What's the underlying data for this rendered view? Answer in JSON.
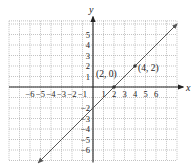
{
  "chart_data": {
    "type": "line",
    "title": "",
    "xlabel": "x",
    "ylabel": "y",
    "xlim": [
      -8,
      8
    ],
    "ylim": [
      -7,
      6.3
    ],
    "grid": true,
    "x_tick_labels": [
      "-6",
      "-5",
      "-4",
      "-3",
      "-2",
      "-1",
      "1",
      "2",
      "3",
      "4",
      "5",
      "6"
    ],
    "x_ticks": [
      -6,
      -5,
      -4,
      -3,
      -2,
      -1,
      1,
      2,
      3,
      4,
      5,
      6
    ],
    "y_tick_labels": [
      "5",
      "4",
      "3",
      "2",
      "1",
      "-2",
      "-3",
      "-4",
      "-5",
      "-6"
    ],
    "y_ticks": [
      5,
      4,
      3,
      2,
      1,
      -2,
      -3,
      -4,
      -5,
      -6
    ],
    "series": [
      {
        "name": "y = x - 2",
        "x": [
          -5.2,
          8
        ],
        "y": [
          -7.2,
          6
        ],
        "color": "#555555",
        "arrows": "both"
      }
    ],
    "points": [
      {
        "x": 2,
        "y": 0,
        "label": "(2, 0)"
      },
      {
        "x": 4,
        "y": 2,
        "label": "(4, 2)"
      }
    ],
    "annotations": [
      "(2, 0)",
      "(4, 2)"
    ],
    "legend": null
  },
  "style": {
    "axis_color": "#222222",
    "grid_color": "#9a9a9a",
    "line_color": "#555555",
    "point_color": "#333333"
  },
  "layout": {
    "origin_px": [
      93,
      87
    ],
    "unit_px": 10.5
  }
}
